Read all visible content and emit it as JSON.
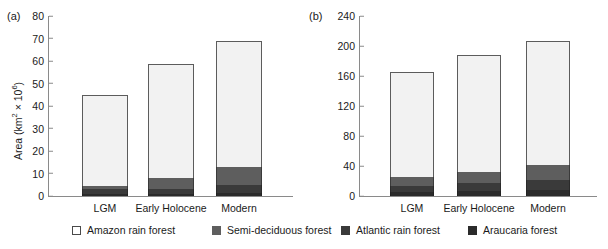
{
  "legend": {
    "items": [
      {
        "key": "amazon",
        "label": "Amazon rain forest",
        "color": "#ffffff",
        "x": 72
      },
      {
        "key": "semi",
        "label": "Semi-deciduous forest",
        "color": "#5e5e5e",
        "x": 212
      },
      {
        "key": "atlantic",
        "label": "Atlantic rain forest",
        "color": "#3a3a3a",
        "x": 341
      },
      {
        "key": "araucaria",
        "label": "Araucaria forest",
        "color": "#2b2b2b",
        "x": 468
      }
    ]
  },
  "panels": {
    "a": {
      "letter": "(a)"
    },
    "b": {
      "letter": "(b)"
    }
  },
  "chart_data": [
    {
      "id": "a",
      "type": "bar",
      "stacked": true,
      "title": "",
      "panel_letter": "(a)",
      "xlabel": "",
      "ylabel": "Area (km2 × 106)",
      "ylabel_html": "Area (km<sup>2</sup> × 10<sup>6</sup>)",
      "categories": [
        "LGM",
        "Early Holocene",
        "Modern"
      ],
      "yticks": [
        0,
        10,
        20,
        30,
        40,
        50,
        60,
        70,
        80
      ],
      "ylim": [
        0,
        80
      ],
      "grid": false,
      "legend_position": "below-figure",
      "series": [
        {
          "name": "Araucaria forest",
          "key": "araucaria",
          "values": [
            1.0,
            1.0,
            1.5
          ]
        },
        {
          "name": "Atlantic rain forest",
          "key": "atlantic",
          "values": [
            2.0,
            2.0,
            3.5
          ]
        },
        {
          "name": "Semi-deciduous forest",
          "key": "semi",
          "values": [
            1.5,
            5.0,
            8.0
          ]
        },
        {
          "name": "Amazon rain forest",
          "key": "amazon",
          "values": [
            40.5,
            50.5,
            56.0
          ]
        }
      ],
      "totals": [
        45.0,
        58.5,
        69.0
      ]
    },
    {
      "id": "b",
      "type": "bar",
      "stacked": true,
      "title": "",
      "panel_letter": "(b)",
      "xlabel": "",
      "ylabel": "Carbon storage (Gt)",
      "ylabel_html": "Carbon storage (Gt)",
      "categories": [
        "LGM",
        "Early Holocene",
        "Modern"
      ],
      "yticks": [
        0,
        40,
        80,
        120,
        160,
        200,
        240
      ],
      "ylim": [
        0,
        240
      ],
      "grid": false,
      "legend_position": "below-figure",
      "series": [
        {
          "name": "Araucaria forest",
          "key": "araucaria",
          "values": [
            5,
            7,
            8
          ]
        },
        {
          "name": "Atlantic rain forest",
          "key": "atlantic",
          "values": [
            9,
            10,
            13
          ]
        },
        {
          "name": "Semi-deciduous forest",
          "key": "semi",
          "values": [
            11,
            15,
            20
          ]
        },
        {
          "name": "Amazon rain forest",
          "key": "amazon",
          "values": [
            141,
            156,
            166
          ]
        }
      ],
      "totals": [
        166,
        188,
        207
      ]
    }
  ]
}
